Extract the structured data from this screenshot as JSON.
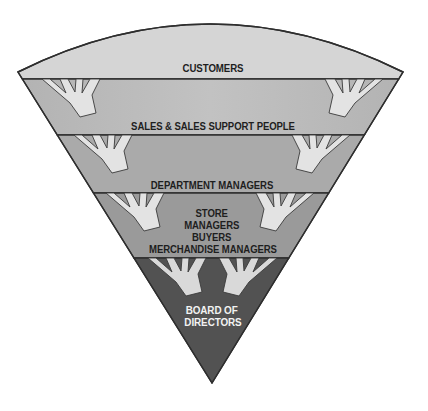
{
  "diagram": {
    "type": "inverted-pyramid",
    "layers": [
      {
        "id": "customers",
        "lines": [
          "CUSTOMERS"
        ]
      },
      {
        "id": "sales",
        "lines": [
          "SALES & SALES SUPPORT PEOPLE"
        ]
      },
      {
        "id": "department",
        "lines": [
          "DEPARTMENT MANAGERS"
        ]
      },
      {
        "id": "store",
        "lines": [
          "STORE",
          "MANAGERS",
          "BUYERS",
          "MERCHANDISE MANAGERS"
        ]
      },
      {
        "id": "board",
        "lines": [
          "BOARD OF",
          "DIRECTORS"
        ]
      }
    ],
    "colors": {
      "customers": "#d5d5d5",
      "sales": "#bababa",
      "department": "#aaaaaa",
      "store": "#9a9a9a",
      "board": "#525252",
      "hand": "#e3e3e3",
      "hand_board": "#d9d9d9",
      "text_dark": "#1e1e1e",
      "text_light": "#f2f2f2",
      "outline": "#2e2e2e"
    }
  }
}
